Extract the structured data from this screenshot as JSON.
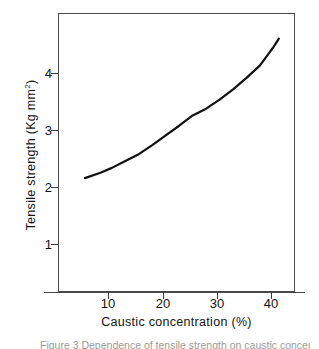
{
  "figure": {
    "caption": "Figure 3  Dependence of tensile strength on caustic concentration",
    "background_color": "#ffffff",
    "axis_color": "#4a4a4a",
    "curve_color": "#111111"
  },
  "chart_data": {
    "type": "line",
    "title": "",
    "xlabel": "Caustic concentration (%)",
    "ylabel": "Tensile strength (Kg mm2)",
    "ylabel_main": "Tensile strength  (Kg  mm",
    "ylabel_sup": "2",
    "ylabel_close": ")",
    "xlim": [
      0,
      44
    ],
    "ylim": [
      0,
      4.9
    ],
    "grid": false,
    "legend": null,
    "xticks": [
      10,
      20,
      30,
      40
    ],
    "xtick_labels": [
      "10",
      "20",
      "30",
      "40"
    ],
    "yticks": [
      1,
      2,
      3,
      4
    ],
    "ytick_labels": [
      "1",
      "2",
      "3",
      "4"
    ],
    "series": [
      {
        "name": "Tensile strength",
        "x": [
          5,
          8,
          10,
          12.5,
          15,
          17.5,
          20,
          22.5,
          25,
          27.5,
          30,
          32.5,
          35,
          37.5,
          40,
          41
        ],
        "values": [
          2.0,
          2.1,
          2.18,
          2.3,
          2.42,
          2.58,
          2.75,
          2.92,
          3.1,
          3.22,
          3.38,
          3.56,
          3.76,
          3.98,
          4.3,
          4.45
        ]
      }
    ]
  }
}
